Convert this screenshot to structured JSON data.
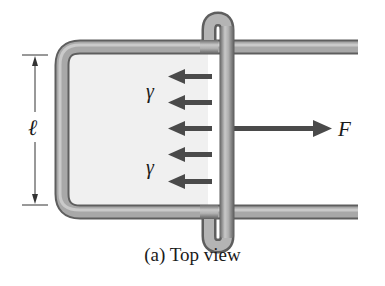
{
  "figure": {
    "caption": "(a) Top view",
    "labels": {
      "length": "ℓ",
      "force": "F",
      "surface_tension_upper": "γ",
      "surface_tension_lower": "γ"
    },
    "colors": {
      "rod": "#8c8c8c",
      "rod_highlight": "#d0d0d0",
      "rod_dark": "#5a5a5a",
      "film": "#f0f0f0",
      "arrow": "#4a4a4a",
      "dimension_line": "#333333",
      "text": "#1a1a1a"
    },
    "surface_tension_arrow_count": 5
  }
}
